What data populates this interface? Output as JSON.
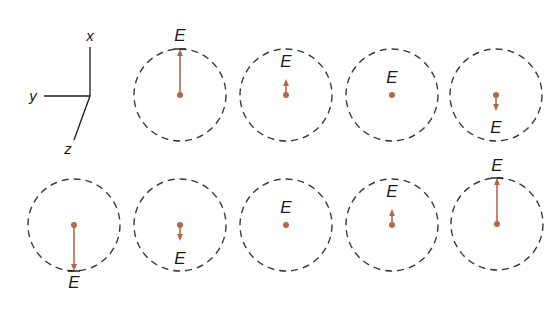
{
  "figure": {
    "colors": {
      "arrow": "#b5674a",
      "circle": "#3a3a3a",
      "axes": "#1a1a1a",
      "label": "#1a1a1a"
    },
    "axes": {
      "origin": [
        90,
        96
      ],
      "x": {
        "label": "x",
        "end": [
          90,
          47
        ],
        "label_pos": [
          90,
          41
        ]
      },
      "y": {
        "label": "y",
        "end": [
          44,
          96
        ],
        "label_pos": [
          33,
          101
        ]
      },
      "z": {
        "label": "z",
        "end": [
          74,
          140
        ],
        "label_pos": [
          68,
          154
        ]
      }
    },
    "radius": 46,
    "field_label": "E",
    "frames": [
      {
        "cx": 180,
        "cy": 95,
        "E": 1.0,
        "label_x": 180,
        "label_y": 41
      },
      {
        "cx": 286,
        "cy": 95,
        "E": 0.35,
        "label_x": 286,
        "label_y": 67
      },
      {
        "cx": 392,
        "cy": 95,
        "E": 0.0,
        "label_x": 392,
        "label_y": 83
      },
      {
        "cx": 496,
        "cy": 95,
        "E": -0.35,
        "label_x": 496,
        "label_y": 133
      },
      {
        "cx": 74,
        "cy": 225,
        "E": -1.0,
        "label_x": 74,
        "label_y": 288
      },
      {
        "cx": 180,
        "cy": 225,
        "E": -0.35,
        "label_x": 180,
        "label_y": 264
      },
      {
        "cx": 286,
        "cy": 225,
        "E": 0.0,
        "label_x": 286,
        "label_y": 213
      },
      {
        "cx": 392,
        "cy": 225,
        "E": 0.35,
        "label_x": 392,
        "label_y": 197
      },
      {
        "cx": 497,
        "cy": 224,
        "E": 1.0,
        "label_x": 497,
        "label_y": 171
      }
    ]
  }
}
